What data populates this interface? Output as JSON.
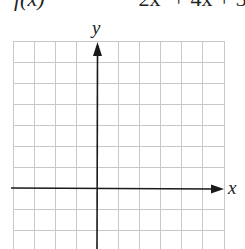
{
  "equation": {
    "lhs": "f(x)",
    "rhs": "−2x² + 4x + 3",
    "note": "partially cut off at top edge"
  },
  "graph": {
    "x_label": "x",
    "y_label": "y",
    "columns": 10,
    "visible_rows": 10,
    "grid_color": "#c8c8c8",
    "axis_color": "#1a1a1a"
  }
}
